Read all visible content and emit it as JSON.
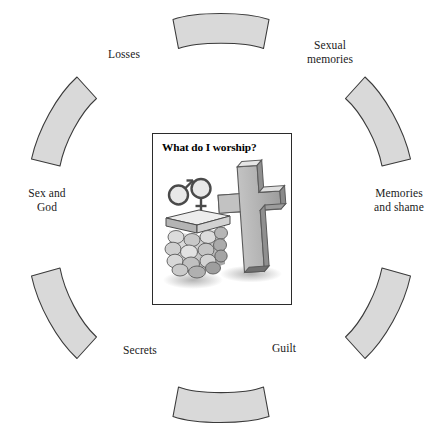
{
  "figure": {
    "name": "worship-circle-diagram",
    "background_color": "#ffffff",
    "width": 442,
    "height": 439
  },
  "ring": {
    "segment_fill": "#d9d9d9",
    "segment_stroke": "#3a3a3a",
    "segment_count": 8,
    "labels": [
      {
        "id": "losses",
        "text": "Losses",
        "position": "top-left"
      },
      {
        "id": "sexual-memories",
        "text": "Sexual\nmemories",
        "position": "top-right"
      },
      {
        "id": "memories-and-shame",
        "text": "Memories\nand shame",
        "position": "right"
      },
      {
        "id": "guilt",
        "text": "Guilt",
        "position": "bottom-right"
      },
      {
        "id": "secrets",
        "text": "Secrets",
        "position": "bottom-left"
      },
      {
        "id": "sex-and-god",
        "text": "Sex and\nGod",
        "position": "left"
      }
    ]
  },
  "center_card": {
    "title": "What do I worship?",
    "illustration": {
      "name": "altar-and-cross-illustration",
      "elements": [
        {
          "icon": "male-symbol-icon",
          "label": "male gender symbol"
        },
        {
          "icon": "female-symbol-icon",
          "label": "female gender symbol"
        },
        {
          "icon": "stone-altar-icon",
          "label": "stone altar with slab"
        },
        {
          "icon": "christian-cross-icon",
          "label": "three-dimensional cross"
        }
      ],
      "colors": {
        "stone_light": "#e4e4e4",
        "stone_mid": "#b9b9b9",
        "stone_dark": "#8a8a8a",
        "outline": "#3f3f3f",
        "shadow": "#bdbdbd"
      }
    }
  }
}
